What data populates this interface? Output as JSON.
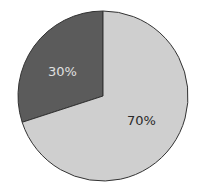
{
  "chart_data": {
    "type": "pie",
    "title": "",
    "categories": [
      "A",
      "B"
    ],
    "values": [
      30,
      70
    ],
    "labels": [
      "30%",
      "70%"
    ],
    "colors": [
      "#5b5b5b",
      "#cfcfcf"
    ],
    "label_colors": [
      "#e0e0e0",
      "#2a2a2a"
    ],
    "start_angle_deg": 0,
    "direction": "counterclockwise",
    "legend": null
  },
  "slices": [
    {
      "label": "30%",
      "value": 30
    },
    {
      "label": "70%",
      "value": 70
    }
  ]
}
